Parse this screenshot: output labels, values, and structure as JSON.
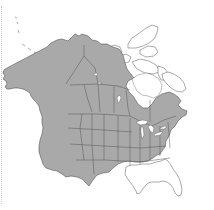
{
  "map": {
    "title": "North America range map",
    "region": "North America",
    "colors": {
      "range_fill": "#a9a9a9",
      "outside_fill": "#ffffff",
      "border": "#555555",
      "background": "#ffffff"
    },
    "legend": {
      "shaded": "Species range (shaded grey)",
      "unshaded": "Outside range (white)"
    },
    "shaded_regions": [
      "Alaska",
      "Yukon",
      "Northwest Territories (mainland)",
      "British Columbia",
      "Alberta",
      "Saskatchewan",
      "Manitoba",
      "Ontario",
      "Quebec (southern)",
      "Atlantic Canada",
      "Western United States",
      "Central United States",
      "Northeastern United States"
    ],
    "unshaded_regions": [
      "Canadian Arctic Archipelago",
      "Nunavut",
      "Hudson Bay",
      "Northern Quebec / Labrador",
      "Texas Gulf coast",
      "Louisiana",
      "Mississippi",
      "Alabama",
      "Georgia",
      "Florida",
      "South Carolina"
    ]
  }
}
